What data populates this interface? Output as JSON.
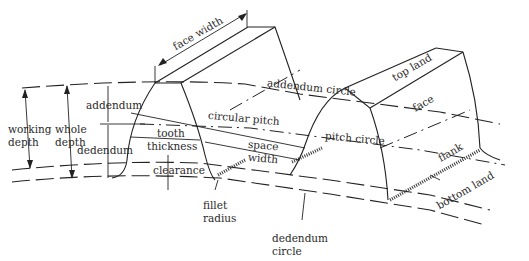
{
  "diagram": {
    "labels": {
      "face_width": "face width",
      "addendum_circle": "addendum circle",
      "top_land": "top land",
      "face": "face",
      "working_depth_1": "working",
      "working_depth_2": "depth",
      "whole_depth_1": "whole",
      "whole_depth_2": "depth",
      "addendum": "addendum",
      "circular_pitch": "circular pitch",
      "pitch_circle": "pitch circle",
      "tooth_thickness_1": "tooth",
      "tooth_thickness_2": "thickness",
      "space_width_1": "space",
      "space_width_2": "width",
      "dedendum": "dedendum",
      "flank": "flank",
      "clearance": "clearance",
      "bottom_land": "bottom land",
      "fillet_radius_1": "fillet",
      "fillet_radius_2": "radius",
      "dedendum_circle_1": "dedendum",
      "dedendum_circle_2": "circle"
    },
    "colors": {
      "ink": "#222222",
      "background": "#ffffff"
    }
  }
}
